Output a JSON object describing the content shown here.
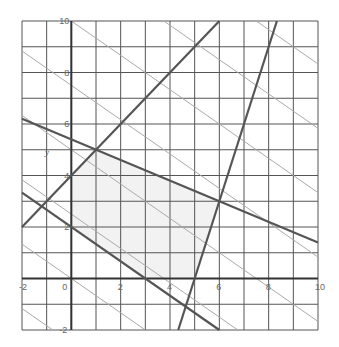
{
  "chart_data": {
    "type": "line",
    "title": "",
    "xlabel": "",
    "ylabel": "y",
    "xlim": [
      -2,
      10
    ],
    "ylim": [
      -2,
      10
    ],
    "grid": true,
    "grid_step": 1,
    "x_tick_labels": [
      "-2",
      "0",
      "2",
      "4",
      "6",
      "8",
      "10"
    ],
    "y_tick_labels": [
      "-2",
      "0",
      "2",
      "4",
      "6",
      "8",
      "10"
    ],
    "constraint_lines": [
      {
        "name": "y = x + 4",
        "slope": 1,
        "intercept": 4
      },
      {
        "name": "y = -0.4x + 5.4",
        "slope": -0.4,
        "intercept": 5.4
      },
      {
        "name": "y = 3x - 15",
        "slope": 3,
        "intercept": -15
      },
      {
        "name": "y = -2/3 x + 2",
        "slope": -0.6667,
        "intercept": 2
      }
    ],
    "level_lines": {
      "slope": -0.6667,
      "intercepts": [
        -5,
        -2.5,
        0,
        2.5,
        5,
        7.5,
        10,
        12.5,
        15
      ]
    },
    "feasible_region": [
      [
        0,
        2
      ],
      [
        0,
        4
      ],
      [
        1,
        5
      ],
      [
        6,
        3
      ],
      [
        5,
        0
      ],
      [
        3,
        0
      ]
    ],
    "colors": {
      "grid": "#555555",
      "axis": "#333333",
      "constraint": "#555555",
      "level": "#aaaaaa",
      "region": "#f2f2f2"
    }
  }
}
